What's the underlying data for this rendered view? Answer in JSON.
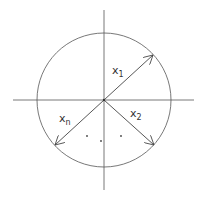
{
  "diagram": {
    "colors": {
      "stroke": "#444444",
      "background": "#ffffff"
    },
    "vectors": [
      {
        "name": "x1",
        "base": "x",
        "subscript": "1"
      },
      {
        "name": "x2",
        "base": "x",
        "subscript": "2"
      },
      {
        "name": "xn",
        "base": "x",
        "subscript": "n"
      }
    ],
    "ellipsis": "· · ·"
  }
}
